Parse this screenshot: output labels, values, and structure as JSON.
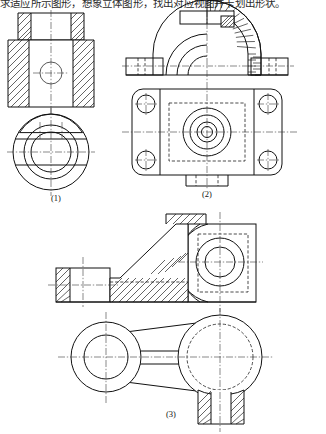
{
  "page": {
    "header_text": "求适应所示图形，想象立体图形，找出对应视图并卡划出形状。",
    "background_color": "#ffffff",
    "line_color": "#111111",
    "width": 326,
    "height": 434
  },
  "figures": [
    {
      "id": "figure-1",
      "caption": "(1)",
      "description": "Sectioned front view of a stepped cylindrical bushing above its circular top view",
      "views": [
        {
          "name": "front-section-view",
          "type": "full-section",
          "features": [
            "upper small flange",
            "lower body",
            "hatched walls",
            "central bore",
            "vertical centre line"
          ]
        },
        {
          "name": "top-view",
          "type": "orthographic",
          "features": [
            "outer circle",
            "inner bore circle",
            "two flat sides",
            "horizontal centre line",
            "vertical centre line"
          ]
        }
      ]
    },
    {
      "id": "figure-2",
      "caption": "(2)",
      "description": "Bearing pedestal — half-sectioned front view above a rectangular top view with four bolt holes",
      "views": [
        {
          "name": "front-half-section-view",
          "type": "half-section",
          "features": [
            "semicircular arch",
            "radially hatched right half",
            "base flanges",
            "top rib block",
            "hidden bolt lines"
          ]
        },
        {
          "name": "top-view",
          "type": "orthographic",
          "features": [
            "rounded rectangular plate",
            "four corner bolt holes",
            "four concentric centre circles",
            "dashed inner rectangle",
            "bottom tab"
          ]
        }
      ]
    },
    {
      "id": "figure-3",
      "caption": "(3)",
      "description": "Bracket / rocker arm — sectioned front view above a plan view of the lever",
      "views": [
        {
          "name": "front-section-view",
          "type": "full-section",
          "features": [
            "left foot block",
            "inclined hatched web",
            "right boss with bore",
            "dashed outline",
            "centre lines"
          ]
        },
        {
          "name": "plan-view",
          "type": "orthographic",
          "features": [
            "left circular boss",
            "tapered connecting arm",
            "right large circular boss",
            "hatched base block below",
            "hidden circle"
          ]
        }
      ]
    }
  ]
}
